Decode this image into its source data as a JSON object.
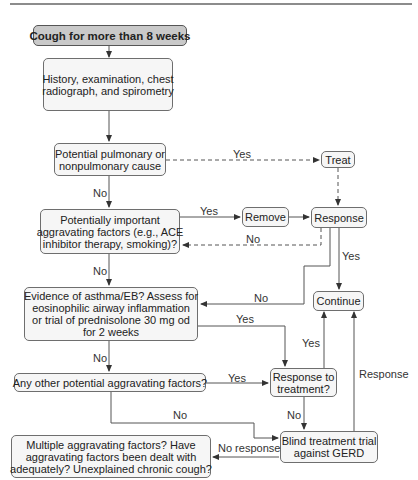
{
  "nodes": {
    "start": {
      "lines": [
        "Cough for more than 8 weeks"
      ]
    },
    "history": {
      "lines": [
        "History, examination, chest",
        "radiograph, and spirometry"
      ]
    },
    "pulmonary": {
      "lines": [
        "Potential pulmonary or",
        "nonpulmonary cause"
      ]
    },
    "treat": {
      "lines": [
        "Treat"
      ]
    },
    "aggravating": {
      "lines": [
        "Potentially important",
        "aggravating factors (e.g., ACE",
        "inhibitor therapy, smoking)?"
      ]
    },
    "remove": {
      "lines": [
        "Remove"
      ]
    },
    "response": {
      "lines": [
        "Response"
      ]
    },
    "asthma": {
      "lines": [
        "Evidence of asthma/EB? Assess for",
        "eosinophilic airway inflammation",
        "or trial of prednisolone 30 mg od",
        "for 2 weeks"
      ]
    },
    "continue": {
      "lines": [
        "Continue"
      ]
    },
    "other": {
      "lines": [
        "Any other potential aggravating factors?"
      ]
    },
    "response_treatment": {
      "lines": [
        "Response to",
        "treatment?"
      ]
    },
    "gerd": {
      "lines": [
        "Blind treatment trial",
        "against GERD"
      ]
    },
    "multiple": {
      "lines": [
        "Multiple aggravating factors? Have",
        "aggravating factors been dealt with",
        "adequately? Unexplained chronic cough?"
      ]
    }
  },
  "edge_labels": {
    "pulmonary_yes": "Yes",
    "pulmonary_no": "No",
    "aggravating_yes": "Yes",
    "response_no": "No",
    "response_yes": "Yes",
    "aggravating_no": "No",
    "response_to_asthma_no": "No",
    "asthma_yes": "Yes",
    "asthma_no": "No",
    "treatment_yes": "Yes",
    "other_yes": "Yes",
    "other_no": "No",
    "treatment_no": "No",
    "gerd_response": "Response",
    "gerd_no_response": "No response"
  },
  "colors": {
    "start_fill": "#c9c9c9",
    "box_fill": "#f6f6f6",
    "line": "#444444"
  }
}
